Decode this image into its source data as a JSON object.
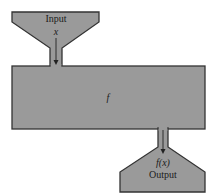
{
  "diagram": {
    "input": {
      "label": "Input",
      "variable": "x"
    },
    "machine": {
      "label": "f"
    },
    "output": {
      "label": "Output",
      "expression": "f(x)"
    },
    "colors": {
      "fill": "#9a9a9a",
      "stroke": "#333333",
      "background": "#ffffff"
    }
  }
}
